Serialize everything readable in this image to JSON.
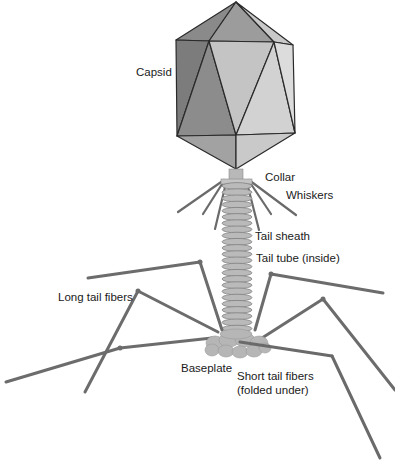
{
  "diagram": {
    "labels": {
      "capsid": "Capsid",
      "collar": "Collar",
      "whiskers": "Whiskers",
      "tail_sheath": "Tail sheath",
      "tail_tube": "Tail tube (inside)",
      "long_tail_fibers": "Long tail fibers",
      "baseplate": "Baseplate",
      "short_tail_fibers_line1": "Short tail fibers",
      "short_tail_fibers_line2": "(folded under)"
    },
    "colors": {
      "outline": "#2a2a2a",
      "face_dark": "#7f7f7f",
      "face_mid": "#9a9a9a",
      "face_light": "#c6c6c6",
      "face_lighter": "#d6d6d6",
      "sheath": "#b8b8b8",
      "fiber": "#6e6e6e",
      "baseplate": "#b5b5b5"
    }
  }
}
